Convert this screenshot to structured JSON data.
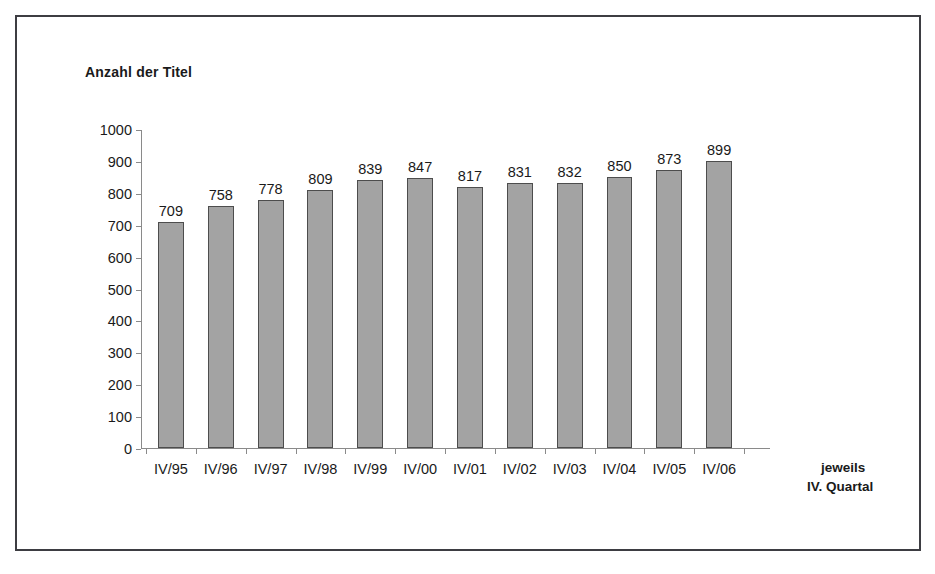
{
  "frame": {
    "border_color": "#3d3d42"
  },
  "chart_data": {
    "type": "bar",
    "title": "Anzahl der Titel",
    "subtitle": "",
    "xlabel_line_1": "jeweils",
    "xlabel_line_2": "IV. Quartal",
    "ylabel": "",
    "categories": [
      "IV/95",
      "IV/96",
      "IV/97",
      "IV/98",
      "IV/99",
      "IV/00",
      "IV/01",
      "IV/02",
      "IV/03",
      "IV/04",
      "IV/05",
      "IV/06"
    ],
    "values": [
      709,
      758,
      778,
      809,
      839,
      847,
      817,
      831,
      832,
      850,
      873,
      899
    ],
    "ylim": [
      0,
      1000
    ],
    "ytick_labels": [
      "1000",
      "900",
      "800",
      "700",
      "600",
      "500",
      "400",
      "300",
      "200",
      "100",
      "0"
    ],
    "ytick_values": [
      1000,
      900,
      800,
      700,
      600,
      500,
      400,
      300,
      200,
      100,
      0
    ],
    "grid": false,
    "legend": null,
    "legend_position": "none",
    "bar_fill_color": "#a3a3a3",
    "bar_border_color": "#4d4d4d",
    "axis_color": "#8a8a8a",
    "text_color": "#1a1a1a",
    "data_labels_shown": true
  }
}
